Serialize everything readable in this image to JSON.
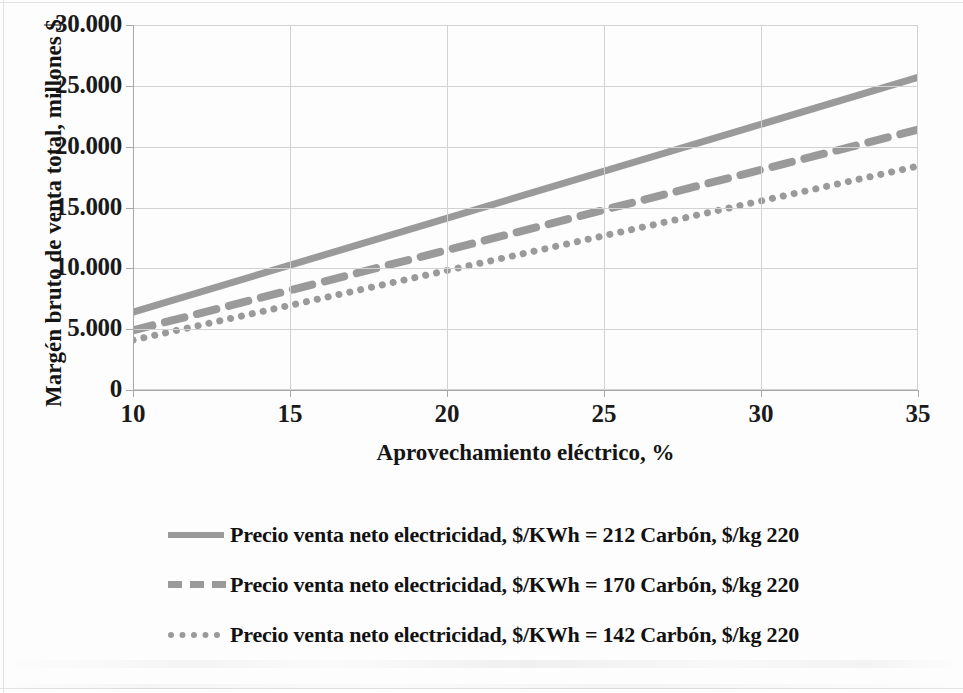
{
  "chart_data": {
    "type": "line",
    "title": "",
    "xlabel": "Aprovechamiento eléctrico, %",
    "ylabel": "Margén bruto de venta total, millones $",
    "x": [
      10,
      35
    ],
    "xlim": [
      10,
      35
    ],
    "ylim": [
      0,
      30000
    ],
    "xticks": [
      "10",
      "15",
      "20",
      "25",
      "30",
      "35"
    ],
    "yticks": [
      "0",
      "5.000",
      "10.000",
      "15.000",
      "20.000",
      "25.000",
      "30.000"
    ],
    "ytick_values": [
      0,
      5000,
      10000,
      15000,
      20000,
      25000,
      30000
    ],
    "xtick_values": [
      10,
      15,
      20,
      25,
      30,
      35
    ],
    "grid": true,
    "legend_position": "bottom",
    "line_color": "#9a9a9a",
    "series": [
      {
        "name": "Precio venta neto electricidad, $/KWh = 212  Carbón, $/kg 220",
        "style": "solid",
        "values": [
          6400,
          25700
        ]
      },
      {
        "name": "Precio venta neto electricidad, $/KWh = 170  Carbón, $/kg 220",
        "style": "dashed",
        "values": [
          4900,
          21400
        ]
      },
      {
        "name": "Precio venta neto electricidad, $/KWh = 142  Carbón, $/kg 220",
        "style": "dotted",
        "values": [
          4100,
          18400
        ]
      }
    ]
  },
  "axis": {
    "y_title": "Margén bruto de venta total, millones $",
    "x_title": "Aprovechamiento eléctrico, %",
    "y_ticks": [
      "30.000",
      "25.000",
      "20.000",
      "15.000",
      "10.000",
      "5.000",
      "0"
    ],
    "x_ticks": [
      "10",
      "15",
      "20",
      "25",
      "30",
      "35"
    ]
  },
  "legend": {
    "entries": [
      {
        "label": "Precio venta neto electricidad, $/KWh = 212  Carbón, $/kg 220",
        "style": "solid"
      },
      {
        "label": "Precio venta neto electricidad, $/KWh = 170  Carbón, $/kg 220",
        "style": "dashed"
      },
      {
        "label": "Precio venta neto electricidad, $/KWh = 142  Carbón, $/kg 220",
        "style": "dotted"
      }
    ]
  },
  "colors": {
    "series_line": "#9a9a9a",
    "gridline": "#d2d2d2",
    "axis": "#a8a8a8",
    "text": "#111111",
    "background": "#fdfdfd"
  }
}
